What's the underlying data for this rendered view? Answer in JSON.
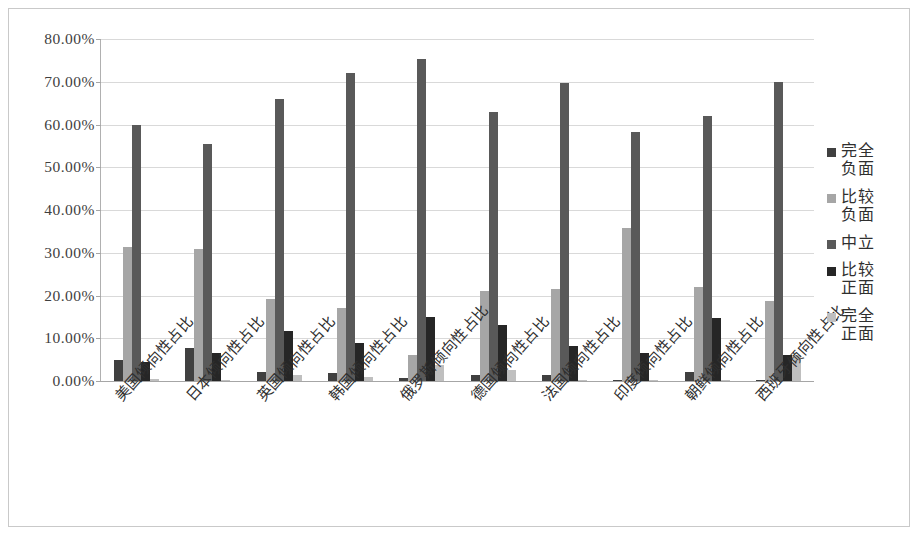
{
  "chart_data": {
    "type": "bar",
    "title": "",
    "xlabel": "",
    "ylabel": "",
    "ylim": [
      0,
      80
    ],
    "ytick_labels": [
      "0.00%",
      "10.00%",
      "20.00%",
      "30.00%",
      "40.00%",
      "50.00%",
      "60.00%",
      "70.00%",
      "80.00%"
    ],
    "ytick_values": [
      0,
      10,
      20,
      30,
      40,
      50,
      60,
      70,
      80
    ],
    "grid": true,
    "legend_position": "right",
    "categories": [
      "美国倾向性占比",
      "日本倾向性占比",
      "英国倾向性占比",
      "韩国倾向性占比",
      "俄罗斯倾向性占比",
      "德国倾向性占比",
      "法国倾向性占比",
      "印度倾向性占比",
      "朝鲜倾向性占比",
      "西班牙倾向性占比"
    ],
    "series": [
      {
        "name": "完全负面",
        "color": "#404040",
        "values": [
          4.8,
          7.7,
          2.0,
          1.8,
          0.6,
          1.3,
          1.4,
          0.2,
          2.1,
          0.2
        ]
      },
      {
        "name": "比较负面",
        "color": "#a6a6a6",
        "values": [
          31.3,
          30.8,
          19.3,
          17.0,
          6.2,
          21.1,
          21.6,
          35.8,
          22.0,
          18.7
        ]
      },
      {
        "name": "中立",
        "color": "#595959",
        "values": [
          59.8,
          55.5,
          66.0,
          72.0,
          75.3,
          63.0,
          69.7,
          58.3,
          62.0,
          70.0
        ]
      },
      {
        "name": "比较正面",
        "color": "#262626",
        "values": [
          4.5,
          6.6,
          11.7,
          9.0,
          15.0,
          13.0,
          8.3,
          6.5,
          14.7,
          6.2
        ]
      },
      {
        "name": "完全正面",
        "color": "#bfbfbf",
        "values": [
          0.4,
          0.2,
          1.5,
          1.0,
          3.8,
          2.6,
          0.3,
          0.2,
          0.3,
          6.2
        ]
      }
    ]
  },
  "legend": {
    "items": [
      {
        "label_line1": "完全",
        "label_line2": "负面"
      },
      {
        "label_line1": "比较",
        "label_line2": "负面"
      },
      {
        "label_line1": "中立",
        "label_line2": ""
      },
      {
        "label_line1": "比较",
        "label_line2": "正面"
      },
      {
        "label_line1": "完全",
        "label_line2": "正面"
      }
    ]
  }
}
